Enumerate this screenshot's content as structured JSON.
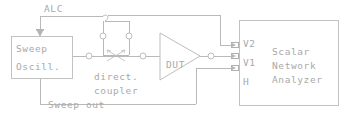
{
  "diagram": {
    "background_color": "#ffffff",
    "line_color": "#bdbdbd",
    "text_color": "#a9a9a9"
  },
  "labels": {
    "alc": "ALC",
    "sweep": "Sweep",
    "oscill": "Oscill.",
    "direct": "direct.",
    "coupler": "coupler",
    "dut": "DUT",
    "sweep_out": "Sweep out",
    "port_v2": "V2",
    "port_v1": "V1",
    "port_h": "H",
    "analyzer_line1": "Scalar",
    "analyzer_line2": "Network",
    "analyzer_line3": "Analyzer"
  },
  "blocks": [
    {
      "id": "sweep-oscillator",
      "label": "Sweep Oscill.",
      "shape": "rectangle"
    },
    {
      "id": "directional-coupler",
      "label": "direct. coupler",
      "shape": "coupler"
    },
    {
      "id": "device-under-test",
      "label": "DUT",
      "shape": "triangle"
    },
    {
      "id": "scalar-network-analyzer",
      "label": "Scalar Network Analyzer",
      "shape": "rectangle"
    }
  ],
  "ports": [
    {
      "id": "v2",
      "label": "V2"
    },
    {
      "id": "v1",
      "label": "V1"
    },
    {
      "id": "h",
      "label": "H"
    }
  ],
  "connections": [
    {
      "id": "alc-feedback",
      "label": "ALC",
      "from": "directional-coupler",
      "to": "sweep-oscillator"
    },
    {
      "id": "coupled-port-to-v2",
      "from": "directional-coupler",
      "to": "v2"
    },
    {
      "id": "source-to-coupler",
      "from": "sweep-oscillator",
      "to": "directional-coupler"
    },
    {
      "id": "coupler-to-dut",
      "from": "directional-coupler",
      "to": "device-under-test"
    },
    {
      "id": "dut-to-v1",
      "from": "device-under-test",
      "to": "v1"
    },
    {
      "id": "sweep-out-to-h",
      "label": "Sweep out",
      "from": "sweep-oscillator",
      "to": "h"
    }
  ]
}
